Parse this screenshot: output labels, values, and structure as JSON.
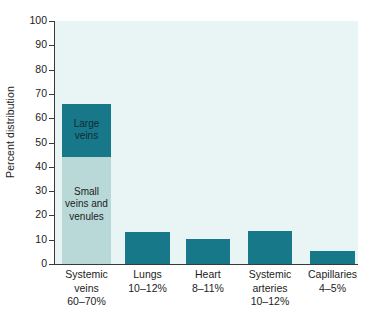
{
  "chart_data": {
    "type": "bar",
    "title": "",
    "subtitle": "",
    "xlabel": "",
    "ylabel": "Percent distribution",
    "ylim": [
      0,
      100
    ],
    "xlim": [
      0,
      5
    ],
    "grid": false,
    "legend": "none",
    "stacked": true,
    "y_ticks": [
      100,
      90,
      80,
      70,
      60,
      50,
      40,
      30,
      20,
      10,
      0
    ],
    "y_tick_labels": [
      "100",
      "90",
      "80",
      "70",
      "60",
      "50",
      "40",
      "30",
      "20",
      "10",
      "0"
    ],
    "categories": [
      "Systemic veins",
      "Lungs",
      "Heart",
      "Systemic arteries",
      "Capillaries"
    ],
    "category_ranges": [
      "60–70%",
      "10–12%",
      "8–11%",
      "10–12%",
      "4–5%"
    ],
    "values": [
      66,
      13,
      10.5,
      13.5,
      5.3
    ],
    "series": [
      {
        "name": "Small veins and venules",
        "color": "#b9d9d8",
        "values": [
          44,
          0,
          0,
          0,
          0
        ]
      },
      {
        "name": "Large veins",
        "color": "#17788a",
        "values": [
          22,
          13,
          10.5,
          13.5,
          5.3
        ]
      }
    ],
    "annotations": [
      {
        "text": "Large\nveins",
        "category": "Systemic veins",
        "segment": "Large veins",
        "value_range": [
          44,
          66
        ]
      },
      {
        "text": "Small\nveins\nand\nvenules",
        "category": "Systemic veins",
        "segment": "Small veins and venules",
        "value_range": [
          0,
          44
        ]
      }
    ],
    "colors": {
      "bar_dark": "#17788a",
      "bar_light": "#b9d9d8",
      "plot_background": "#e9f4f4",
      "axis": "#3a3a3a",
      "text": "#1c1c1c",
      "page_background": "#ffffff"
    }
  },
  "bars": [
    {
      "name": "systemic-veins",
      "label": "Systemic\nveins",
      "range": "60–70%",
      "left_pct": 2.3,
      "width_pct": 16.2,
      "segments": [
        {
          "name": "small-veins-and-venules",
          "tone": "light",
          "from": 0,
          "to": 44,
          "label": "Small\nveins\nand\nvenules"
        },
        {
          "name": "large-veins",
          "tone": "dark",
          "from": 44,
          "to": 66,
          "label": "Large\nveins"
        }
      ]
    },
    {
      "name": "lungs",
      "label": "Lungs",
      "range": "10–12%",
      "left_pct": 23.1,
      "width_pct": 14.9,
      "segments": [
        {
          "name": "lungs-bar",
          "tone": "dark",
          "from": 0,
          "to": 13,
          "label": ""
        }
      ]
    },
    {
      "name": "heart",
      "label": "Heart",
      "range": "8–11%",
      "left_pct": 43.2,
      "width_pct": 14.5,
      "segments": [
        {
          "name": "heart-bar",
          "tone": "dark",
          "from": 0,
          "to": 10.5,
          "label": ""
        }
      ]
    },
    {
      "name": "systemic-arteries",
      "label": "Systemic\narteries",
      "range": "10–12%",
      "left_pct": 63.7,
      "width_pct": 14.5,
      "segments": [
        {
          "name": "systemic-arteries-bar",
          "tone": "dark",
          "from": 0,
          "to": 13.5,
          "label": ""
        }
      ]
    },
    {
      "name": "capillaries",
      "label": "Capillaries",
      "range": "4–5%",
      "left_pct": 84.2,
      "width_pct": 14.8,
      "segments": [
        {
          "name": "capillaries-bar",
          "tone": "dark",
          "from": 0,
          "to": 5.3,
          "label": ""
        }
      ]
    }
  ]
}
